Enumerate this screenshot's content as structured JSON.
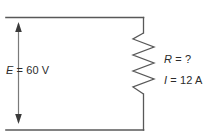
{
  "diagram": {
    "type": "schematic",
    "width": 221,
    "height": 139,
    "background_color": "#ffffff",
    "line_color": "#555555",
    "text_color": "#2b2b2b"
  },
  "labels": {
    "source": {
      "symbol": "E",
      "equals": " = ",
      "value": "60 V",
      "full": "E = 60 V"
    },
    "resistance": {
      "symbol": "R",
      "equals": " = ",
      "value": "?",
      "full": "R = ?"
    },
    "current": {
      "symbol": "I",
      "equals": " = ",
      "value": "12 A",
      "full": "I = 12 A"
    }
  },
  "components": {
    "top_wire": {
      "name": "top-conductor",
      "x1": 6,
      "y1": 17,
      "x2": 143,
      "y2": 17
    },
    "bottom_wire": {
      "name": "bottom-conductor",
      "x1": 6,
      "y1": 130,
      "x2": 143,
      "y2": 130
    },
    "right_wire_upper": {
      "name": "right-conductor-upper",
      "x1": 143,
      "y1": 17,
      "x2": 143,
      "y2": 33
    },
    "right_wire_lower": {
      "name": "right-conductor-lower",
      "x1": 143,
      "y1": 94,
      "x2": 143,
      "y2": 130
    },
    "resistor": {
      "name": "resistor-zigzag",
      "orientation": "vertical",
      "x_center": 143,
      "y_top": 33,
      "y_bottom": 94,
      "amplitude": 11,
      "peaks": 7
    },
    "voltage_arrow": {
      "name": "voltage-arrow",
      "orientation": "vertical",
      "double_headed": true,
      "x": 18,
      "y_top": 23,
      "y_bottom": 123
    }
  }
}
